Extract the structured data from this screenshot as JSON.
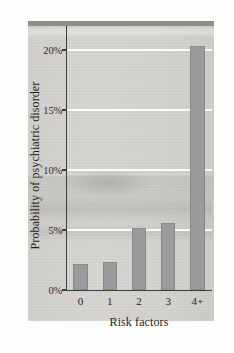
{
  "chart_data": {
    "type": "bar",
    "title": "",
    "xlabel": "Risk factors",
    "ylabel": "Probability of psychiatric disorder",
    "categories": [
      "0",
      "1",
      "2",
      "3",
      "4+"
    ],
    "values": [
      2.2,
      2.3,
      5.2,
      5.6,
      20.3
    ],
    "value_unit": "percent",
    "ylim": [
      0,
      22
    ],
    "yticks": [
      0,
      5,
      10,
      15,
      20
    ],
    "ytick_labels": [
      "0%",
      "5%",
      "10%",
      "15%",
      "20%"
    ],
    "grid": "horizontal-white",
    "legend": "none",
    "bar_color": "#9a9b9c",
    "gridline_color": "#ffffff",
    "axis_color": "#3d3d3b",
    "page_color": "#d6d5d1"
  }
}
